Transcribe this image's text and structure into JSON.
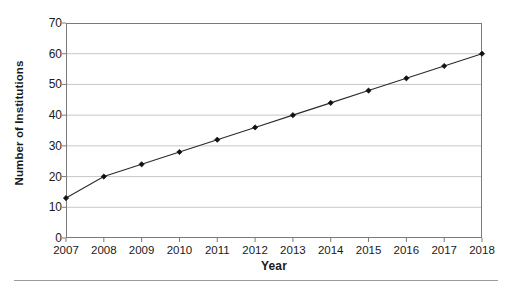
{
  "chart_data": {
    "type": "line",
    "title": "",
    "xlabel": "Year",
    "ylabel": "Number of Institutions",
    "categories": [
      "2007",
      "2008",
      "2009",
      "2010",
      "2011",
      "2012",
      "2013",
      "2014",
      "2015",
      "2016",
      "2017",
      "2018"
    ],
    "values": [
      13,
      20,
      24,
      28,
      32,
      36,
      40,
      44,
      48,
      52,
      56,
      60
    ],
    "series": [
      {
        "name": "Number of Institutions",
        "values": [
          13,
          20,
          24,
          28,
          32,
          36,
          40,
          44,
          48,
          52,
          56,
          60
        ]
      }
    ],
    "ylim": [
      0,
      70
    ],
    "ytick_labels": [
      "0",
      "10",
      "20",
      "30",
      "40",
      "50",
      "60",
      "70"
    ],
    "ytick_values": [
      0,
      10,
      20,
      30,
      40,
      50,
      60,
      70
    ],
    "xtick_labels": [
      "2007",
      "2008",
      "2009",
      "2010",
      "2011",
      "2012",
      "2013",
      "2014",
      "2015",
      "2016",
      "2017",
      "2018"
    ],
    "grid": "horizontal",
    "legend": "none",
    "marker": "diamond",
    "colors": {
      "line": "#2b2b2b",
      "marker": "#111111",
      "gridline": "#c8c8c8",
      "axis": "#7a7a7a",
      "plot_background": "#ffffff",
      "text": "#1a1a1a"
    }
  }
}
